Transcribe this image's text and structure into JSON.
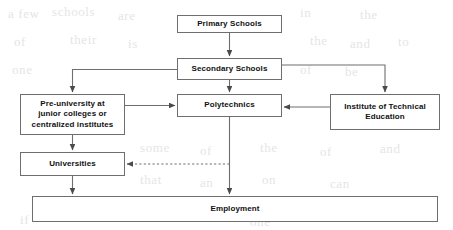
{
  "diagram": {
    "stroke_color": "#6e6e6e",
    "text_color": "#111111",
    "background_color": "#ffffff",
    "nodes": [
      {
        "id": "primary",
        "label": "Primary Schools",
        "lines": [
          "Primary Schools"
        ]
      },
      {
        "id": "secondary",
        "label": "Secondary Schools",
        "lines": [
          "Secondary Schools"
        ]
      },
      {
        "id": "preu",
        "label": "Pre-university at junior colleges or centralized institutes",
        "lines": [
          "Pre-university at",
          "junior colleges or",
          "centralized institutes"
        ]
      },
      {
        "id": "poly",
        "label": "Polytechnics",
        "lines": [
          "Polytechnics"
        ]
      },
      {
        "id": "ite",
        "label": "Institute of Technical Education",
        "lines": [
          "Institute of Technical",
          "Education"
        ]
      },
      {
        "id": "uni",
        "label": "Universities",
        "lines": [
          "Universities"
        ]
      },
      {
        "id": "employ",
        "label": "Employment",
        "lines": [
          "Employment"
        ]
      }
    ],
    "edges": [
      {
        "from": "primary",
        "to": "secondary",
        "style": "solid",
        "arrow": true
      },
      {
        "from": "secondary",
        "to": "preu",
        "style": "solid",
        "arrow": true
      },
      {
        "from": "secondary",
        "to": "poly",
        "style": "solid",
        "arrow": true
      },
      {
        "from": "secondary",
        "to": "ite",
        "style": "solid",
        "arrow": true
      },
      {
        "from": "preu",
        "to": "poly",
        "style": "solid",
        "arrow": true
      },
      {
        "from": "ite",
        "to": "poly",
        "style": "solid",
        "arrow": true
      },
      {
        "from": "preu",
        "to": "uni",
        "style": "solid",
        "arrow": true
      },
      {
        "from": "poly",
        "to": "uni",
        "style": "dashed",
        "arrow": true
      },
      {
        "from": "uni",
        "to": "employ",
        "style": "solid",
        "arrow": true
      },
      {
        "from": "poly",
        "to": "employ",
        "style": "solid",
        "arrow": true
      }
    ]
  },
  "background_bleed": {
    "note": "faint show-through text from reverse of scanned page",
    "fragments": [
      "a few",
      "schools",
      "are",
      "in",
      "the",
      "of",
      "their",
      "is",
      "the",
      "and",
      "to",
      "one",
      "of",
      "be",
      "some",
      "of",
      "the",
      "of",
      "and",
      "that",
      "an",
      "on",
      "can",
      "if",
      "one",
      "the"
    ]
  }
}
